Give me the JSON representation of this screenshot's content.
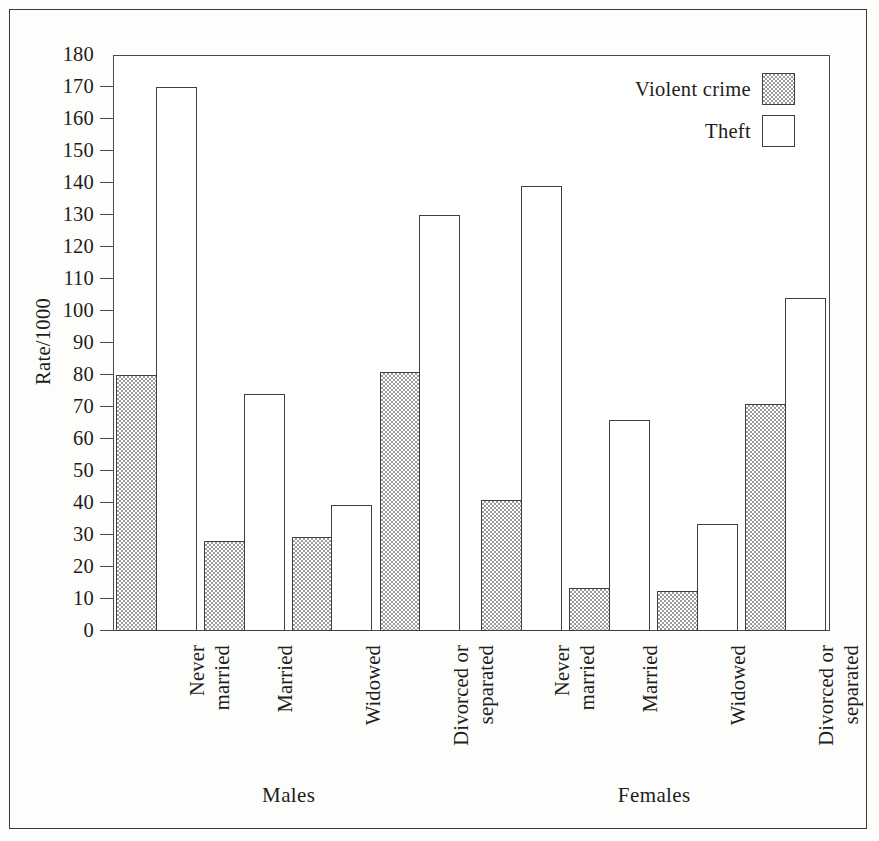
{
  "chart_data": {
    "type": "bar",
    "title": "",
    "xlabel": "",
    "ylabel": "Rate/1000",
    "ylim": [
      0,
      180
    ],
    "ytick_step": 10,
    "yticks": [
      0,
      10,
      20,
      30,
      40,
      50,
      60,
      70,
      80,
      90,
      100,
      110,
      120,
      130,
      140,
      150,
      160,
      170,
      180
    ],
    "grid": false,
    "legend_position": "top-right",
    "groups": [
      "Males",
      "Females"
    ],
    "categories": [
      "Never\nmarried",
      "Married",
      "Widowed",
      "Divorced or\nseparated",
      "Never\nmarried",
      "Married",
      "Widowed",
      "Divorced or\nseparated"
    ],
    "category_group": [
      "Males",
      "Males",
      "Males",
      "Males",
      "Females",
      "Females",
      "Females",
      "Females"
    ],
    "series": [
      {
        "name": "Violent crime",
        "fill": "stipple",
        "values": [
          80,
          28,
          29.5,
          81,
          41,
          13.5,
          12.5,
          71
        ]
      },
      {
        "name": "Theft",
        "fill": "white",
        "values": [
          170,
          74,
          39.5,
          130,
          139,
          66,
          33.5,
          104
        ]
      }
    ],
    "legend": [
      {
        "label": "Violent crime",
        "swatch": "stipple"
      },
      {
        "label": "Theft",
        "swatch": "white"
      }
    ]
  },
  "axis": {
    "y_title": "Rate/1000",
    "y_tick_labels": [
      "0",
      "10",
      "20",
      "30",
      "40",
      "50",
      "60",
      "70",
      "80",
      "90",
      "100",
      "110",
      "120",
      "130",
      "140",
      "150",
      "160",
      "170",
      "180"
    ]
  },
  "x_axis": {
    "category_labels": [
      "Never\nmarried",
      "Married",
      "Widowed",
      "Divorced or\nseparated",
      "Never\nmarried",
      "Married",
      "Widowed",
      "Divorced or\nseparated"
    ],
    "group_labels": [
      "Males",
      "Females"
    ]
  },
  "legend": {
    "rows": [
      {
        "label": "Violent crime"
      },
      {
        "label": "Theft"
      }
    ]
  },
  "colors": {
    "axis_line": "#4a4a4a",
    "bar_outline": "#3f3f3f",
    "stipple_dot": "#9b9b9b",
    "text": "#1d1d1d",
    "frame": "#3a3a3a",
    "background": "#ffffff"
  }
}
